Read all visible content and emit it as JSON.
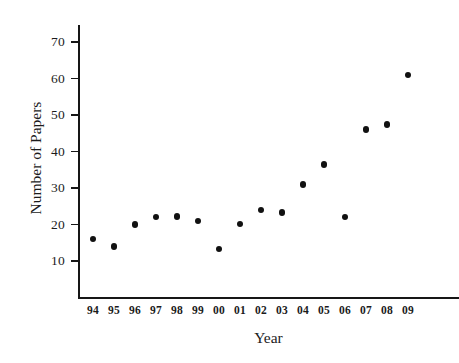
{
  "chart_data": {
    "type": "scatter",
    "title": "",
    "xlabel": "Year",
    "ylabel": "Number of Papers",
    "grid": false,
    "legend": null,
    "marker": {
      "shape": "circle",
      "color": "#111111",
      "size": 6.4
    },
    "background_color": "#ffffff",
    "axis_color": "#161616",
    "categories": [
      "94",
      "95",
      "96",
      "97",
      "98",
      "99",
      "00",
      "01",
      "02",
      "03",
      "04",
      "05",
      "06",
      "07",
      "08",
      "09"
    ],
    "x_tick_labels": [
      "94",
      "95",
      "96",
      "97",
      "98",
      "99",
      "00",
      "01",
      "02",
      "03",
      "04",
      "05",
      "06",
      "07",
      "08",
      "09"
    ],
    "y_tick_labels": [
      "10",
      "20",
      "30",
      "40",
      "50",
      "60",
      "70"
    ],
    "y_ticks": [
      10,
      20,
      30,
      40,
      50,
      60,
      70
    ],
    "ylim": [
      0,
      77
    ],
    "xlim": [
      0,
      17
    ],
    "values": [
      16,
      14,
      20,
      22,
      22.2,
      21,
      13.3,
      20.2,
      24,
      23.3,
      31,
      36.4,
      22,
      46,
      47.4,
      61
    ],
    "points": [
      {
        "x": "94",
        "y": 16
      },
      {
        "x": "95",
        "y": 14
      },
      {
        "x": "96",
        "y": 20
      },
      {
        "x": "97",
        "y": 22
      },
      {
        "x": "98",
        "y": 22.2
      },
      {
        "x": "99",
        "y": 21
      },
      {
        "x": "00",
        "y": 13.3
      },
      {
        "x": "01",
        "y": 20.2
      },
      {
        "x": "02",
        "y": 24
      },
      {
        "x": "03",
        "y": 23.3
      },
      {
        "x": "04",
        "y": 31
      },
      {
        "x": "05",
        "y": 36.4
      },
      {
        "x": "06",
        "y": 22
      },
      {
        "x": "07",
        "y": 46
      },
      {
        "x": "08",
        "y": 47.4
      },
      {
        "x": "09",
        "y": 61
      }
    ]
  },
  "layout": {
    "plot_left_px": 78,
    "plot_right_px": 425,
    "y_value_10_px": 261,
    "y_value_70_px": 42,
    "first_point_x_px": 93,
    "point_spacing_px": 21.0
  }
}
